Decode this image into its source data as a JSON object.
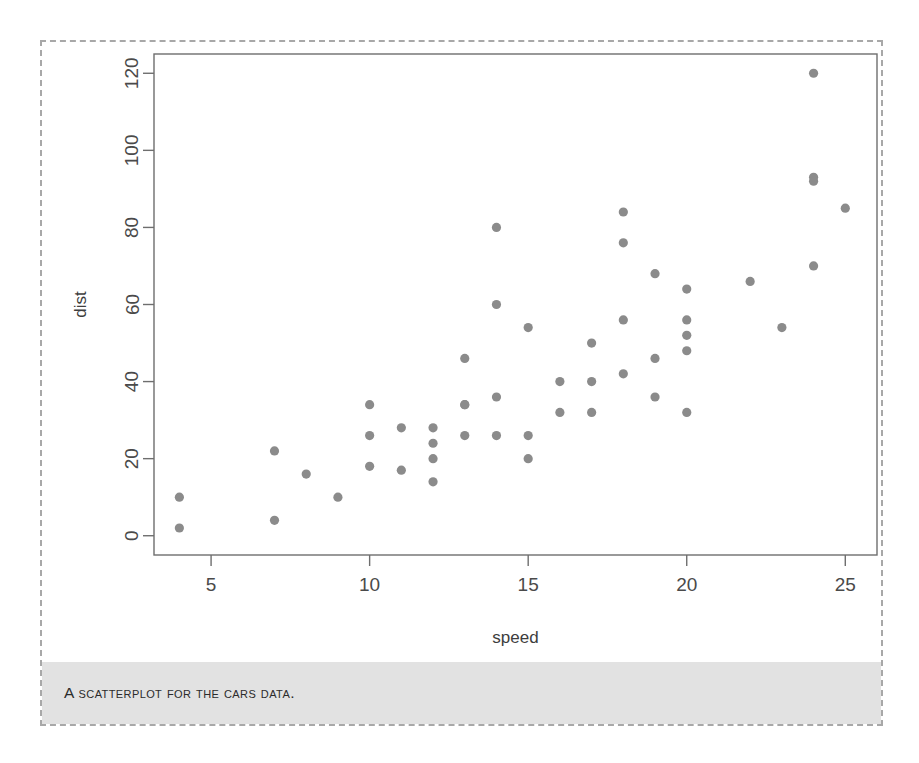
{
  "figure": {
    "caption": "A scatterplot for the cars data.",
    "border_color": "#a8a8a8",
    "caption_band_color": "#e2e2e2",
    "point_color": "#8b8b8b"
  },
  "chart_data": {
    "type": "scatter",
    "title": "",
    "xlabel": "speed",
    "ylabel": "dist",
    "xlim": [
      3.2,
      26.0
    ],
    "ylim": [
      -5,
      125
    ],
    "xticks": [
      5,
      10,
      15,
      20,
      25
    ],
    "yticks": [
      0,
      20,
      40,
      60,
      80,
      100,
      120
    ],
    "xtick_labels": [
      "5",
      "10",
      "15",
      "20",
      "25"
    ],
    "ytick_labels": [
      "0",
      "20",
      "40",
      "60",
      "80",
      "100",
      "120"
    ],
    "grid": false,
    "legend": false,
    "n_points": 50,
    "marker": "filled-circle",
    "x": [
      4,
      4,
      7,
      7,
      8,
      9,
      10,
      10,
      10,
      11,
      11,
      12,
      12,
      12,
      12,
      13,
      13,
      13,
      13,
      14,
      14,
      14,
      14,
      15,
      15,
      15,
      16,
      16,
      17,
      17,
      17,
      18,
      18,
      18,
      18,
      19,
      19,
      19,
      20,
      20,
      20,
      20,
      20,
      22,
      23,
      24,
      24,
      24,
      24,
      25
    ],
    "y": [
      2,
      10,
      4,
      22,
      16,
      10,
      18,
      26,
      34,
      17,
      28,
      14,
      20,
      24,
      28,
      26,
      34,
      34,
      46,
      26,
      36,
      60,
      80,
      20,
      26,
      54,
      32,
      40,
      32,
      40,
      50,
      42,
      56,
      76,
      84,
      36,
      46,
      68,
      32,
      48,
      52,
      56,
      64,
      66,
      54,
      70,
      92,
      93,
      120,
      85
    ],
    "series_name": "cars"
  }
}
